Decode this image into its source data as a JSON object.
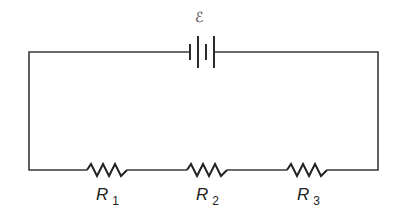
{
  "diagram": {
    "type": "series-circuit",
    "battery": {
      "label": "ℰ"
    },
    "resistors": [
      {
        "name": "R",
        "subscript": "1"
      },
      {
        "name": "R",
        "subscript": "2"
      },
      {
        "name": "R",
        "subscript": "3"
      }
    ],
    "colors": {
      "wire": "#3a3a3a",
      "background": "#ffffff"
    }
  }
}
